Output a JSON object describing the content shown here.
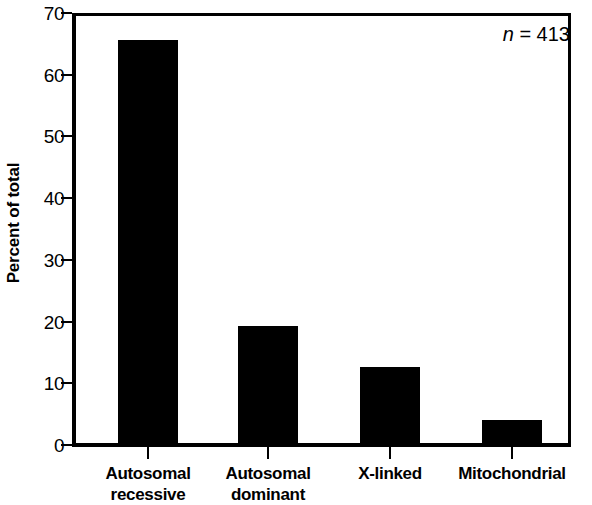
{
  "chart_data": {
    "type": "bar",
    "title": "",
    "xlabel": "",
    "ylabel": "Percent of total",
    "categories": [
      "Autosomal\nrecessive",
      "Autosomal\ndominant",
      "X-linked",
      "Mitochondrial"
    ],
    "values": [
      65.6,
      19.3,
      12.6,
      4.1
    ],
    "ylim": [
      0,
      70
    ],
    "yticks": [
      0,
      10,
      20,
      30,
      40,
      50,
      60,
      70
    ],
    "ytick_labels": [
      "0",
      "10",
      "20",
      "30",
      "40",
      "50",
      "60",
      "70"
    ],
    "grid": false,
    "legend": "none",
    "bar_color": "#000000",
    "annotations": [
      {
        "text_italic": "n",
        "text_rest": " = 413",
        "position": "top-right"
      }
    ]
  },
  "figure": {
    "background_color": "#ffffff",
    "axis_color": "#000000"
  }
}
